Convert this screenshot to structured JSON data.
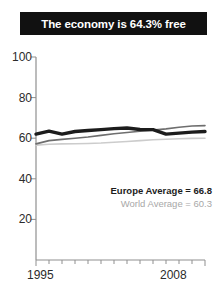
{
  "title": {
    "text": "The economy is 64.3% free"
  },
  "legend": {
    "europe_label": "Europe Average = 66.8",
    "world_label": "World Average = 60.3"
  },
  "axis": {
    "x_start_label": "1995",
    "x_end_label": "2008",
    "y_labels": [
      "100",
      "80",
      "60",
      "40",
      "20"
    ]
  },
  "colors": {
    "banner_background": "#111111",
    "banner_text": "#ffffff",
    "country_line": "#1c1c1c",
    "europe_line": "#6e6e6e",
    "world_line": "#cccccc",
    "axis": "#8f8f8f",
    "tick_text": "#2b2b2b",
    "legend_world_text": "#a8a8a8"
  },
  "chart_data": {
    "type": "line",
    "title": "The economy is 64.3% free",
    "xlabel": "",
    "ylabel": "",
    "xlim": [
      1995,
      2008
    ],
    "ylim": [
      0,
      100
    ],
    "yticks": [
      20,
      40,
      60,
      80,
      100
    ],
    "xticks": [
      1995,
      1996,
      1997,
      1998,
      1999,
      2000,
      2001,
      2002,
      2003,
      2004,
      2005,
      2006,
      2007,
      2008
    ],
    "grid": false,
    "legend_position": "inside-lower-right",
    "x": [
      1995,
      1996,
      1997,
      1998,
      1999,
      2000,
      2001,
      2002,
      2003,
      2004,
      2005,
      2006,
      2007,
      2008
    ],
    "series": [
      {
        "name": "Country",
        "color": "#1c1c1c",
        "width": "thick",
        "values": [
          62.0,
          63.5,
          62.0,
          63.3,
          63.8,
          64.2,
          64.7,
          65.0,
          64.3,
          64.2,
          62.0,
          62.5,
          63.0,
          63.3
        ]
      },
      {
        "name": "Europe Average",
        "color": "#6e6e6e",
        "width": "thin",
        "average": 66.8,
        "values": [
          57.2,
          58.8,
          59.4,
          60.0,
          60.6,
          61.4,
          62.2,
          62.8,
          63.4,
          64.0,
          64.6,
          65.4,
          66.0,
          66.2
        ]
      },
      {
        "name": "World Average",
        "color": "#cccccc",
        "width": "thin",
        "average": 60.3,
        "values": [
          56.6,
          57.0,
          57.2,
          57.3,
          57.4,
          57.6,
          58.0,
          58.4,
          58.8,
          59.2,
          59.5,
          59.7,
          59.9,
          60.0
        ]
      }
    ],
    "annotations": [
      {
        "text": "Europe Average = 66.8",
        "style": "bold-dark"
      },
      {
        "text": "World Average = 60.3",
        "style": "light-gray"
      }
    ]
  }
}
